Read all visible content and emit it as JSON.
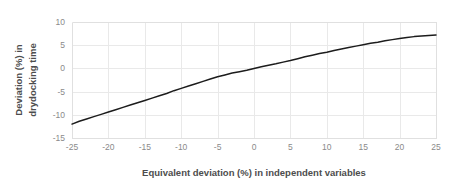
{
  "chart_data": {
    "type": "line",
    "title": "",
    "subtitle": "",
    "xlabel": "Equivalent deviation (%) in independent variables",
    "ylabel": "Deviation (%) in drydocking time",
    "ylabel_line1": "Deviation (%) in",
    "ylabel_line2": "drydocking time",
    "xlim": [
      -25,
      25
    ],
    "ylim": [
      -15,
      10
    ],
    "xticks": [
      -25,
      -20,
      -15,
      -10,
      -5,
      0,
      5,
      10,
      15,
      20,
      25
    ],
    "yticks": [
      -15,
      -10,
      -5,
      0,
      5,
      10
    ],
    "xtick_labels": [
      "-25",
      "-20",
      "-15",
      "-10",
      "-5",
      "0",
      "5",
      "10",
      "15",
      "20",
      "25"
    ],
    "ytick_labels": [
      "-15",
      "-10",
      "-5",
      "0",
      "5",
      "10"
    ],
    "grid": true,
    "grid_color": "#e9e9e9",
    "legend": false,
    "legend_position": "none",
    "line_color": "#1c1c1c",
    "text_color": "#4d4d4d",
    "tick_color": "#8a8a8a",
    "background": "#ffffff",
    "series": [
      {
        "name": "Deviation in drydocking time",
        "x": [
          -25,
          -24,
          -23,
          -22,
          -21,
          -20,
          -19,
          -18,
          -17,
          -16,
          -15,
          -14,
          -13,
          -12,
          -11,
          -10,
          -9,
          -8,
          -7,
          -6,
          -5,
          -4,
          -3,
          -2,
          -1,
          0,
          1,
          2,
          3,
          4,
          5,
          6,
          7,
          8,
          9,
          10,
          11,
          12,
          13,
          14,
          15,
          16,
          17,
          18,
          19,
          20,
          21,
          22,
          23,
          24,
          25
        ],
        "values": [
          -12.0,
          -11.4,
          -10.9,
          -10.4,
          -9.9,
          -9.4,
          -8.9,
          -8.4,
          -7.9,
          -7.4,
          -6.9,
          -6.4,
          -5.9,
          -5.4,
          -4.8,
          -4.3,
          -3.8,
          -3.3,
          -2.8,
          -2.3,
          -1.8,
          -1.4,
          -1.0,
          -0.7,
          -0.4,
          0.0,
          0.35,
          0.7,
          1.0,
          1.35,
          1.7,
          2.1,
          2.5,
          2.85,
          3.2,
          3.5,
          3.85,
          4.2,
          4.5,
          4.8,
          5.1,
          5.4,
          5.65,
          5.95,
          6.2,
          6.45,
          6.65,
          6.85,
          7.0,
          7.1,
          7.2
        ]
      }
    ]
  },
  "plot_geometry": {
    "left": 72,
    "right": 436,
    "top": 22,
    "bottom": 138
  }
}
